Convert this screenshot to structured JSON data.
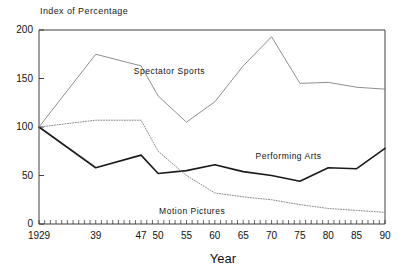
{
  "chart_data": {
    "type": "line",
    "title": "",
    "ylabel": "Index of Percentage",
    "xlabel": "Year",
    "ylim": [
      0,
      200
    ],
    "xlim": [
      1929,
      1990
    ],
    "yticks": [
      0,
      50,
      100,
      150,
      200
    ],
    "xticks": [
      1929,
      1939,
      1947,
      1950,
      1955,
      1960,
      1965,
      1970,
      1975,
      1980,
      1985,
      1990
    ],
    "xtick_labels": [
      "1929",
      "39",
      "47",
      "50",
      "55",
      "60",
      "65",
      "70",
      "75",
      "80",
      "85",
      "90"
    ],
    "grid": false,
    "legend": "inline-annotations",
    "series": [
      {
        "name": "Spectator Sports",
        "style": "solid-thin",
        "color": "#7a7a7a",
        "x": [
          1929,
          1939,
          1947,
          1950,
          1955,
          1960,
          1965,
          1970,
          1975,
          1980,
          1985,
          1990
        ],
        "values": [
          100,
          175,
          163,
          132,
          105,
          126,
          163,
          193,
          145,
          146,
          141,
          139
        ]
      },
      {
        "name": "Performing Arts",
        "style": "solid-thick",
        "color": "#1a1a1a",
        "x": [
          1929,
          1939,
          1947,
          1950,
          1955,
          1960,
          1965,
          1970,
          1975,
          1980,
          1985,
          1990
        ],
        "values": [
          100,
          58,
          71,
          52,
          55,
          61,
          54,
          50,
          44,
          58,
          57,
          78
        ]
      },
      {
        "name": "Motion Pictures",
        "style": "dotted",
        "color": "#8a8a8a",
        "x": [
          1929,
          1939,
          1947,
          1950,
          1955,
          1960,
          1965,
          1970,
          1975,
          1980,
          1985,
          1990
        ],
        "values": [
          100,
          107,
          107,
          75,
          50,
          32,
          28,
          25,
          20,
          16,
          14,
          12
        ]
      }
    ],
    "annotations": [
      {
        "text": "Spectator Sports",
        "x": 1952,
        "y": 158
      },
      {
        "text": "Performing Arts",
        "x": 1973,
        "y": 70
      },
      {
        "text": "Motion Pictures",
        "x": 1956,
        "y": 13
      }
    ]
  }
}
